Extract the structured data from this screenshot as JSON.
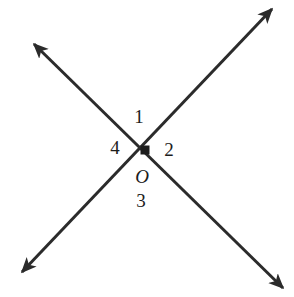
{
  "canvas": {
    "width": 294,
    "height": 297,
    "background": "#ffffff"
  },
  "style": {
    "stroke_color": "#2b2b2b",
    "stroke_width": 3,
    "label_color": "#1c1c1c",
    "vertex_color": "#1c1c1c"
  },
  "figure": {
    "type": "two-intersecting-lines",
    "vertex": {
      "label": "O",
      "x": 145,
      "y": 150,
      "marker": "filled-square",
      "marker_size": 9
    },
    "lines": [
      {
        "name": "line-ne-sw",
        "x1": 272,
        "y1": 9,
        "x2": 22,
        "y2": 272,
        "arrow_start": true,
        "arrow_end": true
      },
      {
        "name": "line-nw-se",
        "x1": 34,
        "y1": 44,
        "x2": 283,
        "y2": 288,
        "arrow_start": true,
        "arrow_end": true
      }
    ],
    "angle_labels": [
      {
        "text": "1",
        "x": 139,
        "y": 116,
        "position": "top"
      },
      {
        "text": "2",
        "x": 169,
        "y": 149,
        "position": "right"
      },
      {
        "text": "3",
        "x": 141,
        "y": 200,
        "position": "bottom"
      },
      {
        "text": "4",
        "x": 115,
        "y": 147,
        "position": "left"
      }
    ],
    "point_label": {
      "text": "O",
      "x": 142,
      "y": 176
    }
  }
}
